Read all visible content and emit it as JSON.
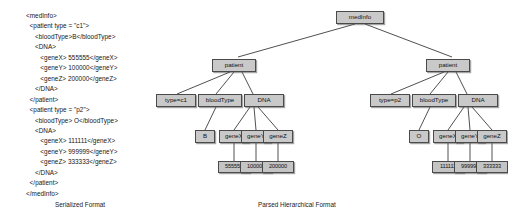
{
  "serialized": {
    "lines": [
      "<medInfo>",
      "  <patient type = \"c1\">",
      "     <bloodType>B</bloodType>",
      "     <DNA>",
      "        <geneX> 555555</geneX>",
      "        <geneY> 100000</geneY>",
      "        <geneZ> 200000</geneZ>",
      "     </DNA>",
      "  </patient>",
      "  <patient type = \"p2\">",
      "     <bloodType> O</bloodType>",
      "     <DNA>",
      "        <geneX> 111111</geneX>",
      "        <geneY> 999999</geneY>",
      "        <geneZ> 333333</geneZ>",
      "     </DNA>",
      "  </patient>",
      "</medInfo>"
    ]
  },
  "tree": {
    "root": "medInfo",
    "patients": [
      {
        "node": "patient",
        "type_attr": "type=c1",
        "bloodtype_label": "bloodType",
        "bloodtype_value": "B",
        "dna_label": "DNA",
        "genes": [
          {
            "label": "geneX",
            "value": "555555"
          },
          {
            "label": "geneY",
            "value": "100000"
          },
          {
            "label": "geneZ",
            "value": "200000"
          }
        ]
      },
      {
        "node": "patient",
        "type_attr": "type=p2",
        "bloodtype_label": "bloodType",
        "bloodtype_value": "O",
        "dna_label": "DNA",
        "genes": [
          {
            "label": "geneX",
            "value": "111111"
          },
          {
            "label": "geneY",
            "value": "999999"
          },
          {
            "label": "geneZ",
            "value": "333333"
          }
        ]
      }
    ]
  },
  "captions": {
    "left": "Serialized Format",
    "right": "Parsed Hierarchical Format"
  },
  "colors": {
    "node_fill": "#c9c9c9",
    "node_border": "#4a4a4a",
    "edge": "#3c3c3c",
    "text": "#161616",
    "background": "#ffffff"
  }
}
